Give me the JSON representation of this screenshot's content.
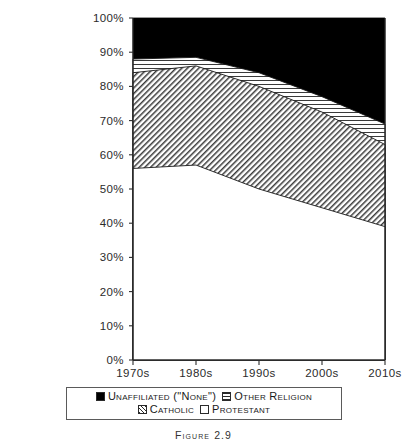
{
  "figure": {
    "caption": "Figure 2.9"
  },
  "legend": {
    "items": [
      {
        "label": "Unaffiliated (\"None\")",
        "swatch": "solid-black-swatch",
        "color": "#000000",
        "fill": "solid"
      },
      {
        "label": "Other Religion",
        "swatch": "horizontal-lines-swatch",
        "color": "#2b2b2b",
        "fill": "horizontal-lines"
      },
      {
        "label": "Catholic",
        "swatch": "diagonal-hatch-swatch",
        "color": "#2b2b2b",
        "fill": "diagonal-hatch"
      },
      {
        "label": "Protestant",
        "swatch": "white-swatch",
        "color": "#ffffff",
        "fill": "none"
      }
    ]
  },
  "chart_data": {
    "type": "area",
    "title": "",
    "subtitle": "",
    "xlabel": "",
    "ylabel": "",
    "stacked": true,
    "stack_total": 100,
    "grid": false,
    "legend_position": "bottom",
    "categories": [
      "1970s",
      "1980s",
      "1990s",
      "2000s",
      "2010s"
    ],
    "x_tick_labels": [
      "1970s",
      "1980s",
      "1990s",
      "2000s",
      "2010s"
    ],
    "y_tick_labels": [
      "0%",
      "10%",
      "20%",
      "30%",
      "40%",
      "50%",
      "60%",
      "70%",
      "80%",
      "90%",
      "100%"
    ],
    "y_ticks": [
      0,
      10,
      20,
      30,
      40,
      50,
      60,
      70,
      80,
      90,
      100
    ],
    "ylim": [
      0,
      100
    ],
    "series": [
      {
        "name": "Protestant",
        "fill": "none",
        "values": [
          56,
          57,
          50,
          44.5,
          39
        ]
      },
      {
        "name": "Catholic",
        "fill": "diagonal-hatch",
        "values": [
          28,
          29,
          30,
          28,
          24
        ]
      },
      {
        "name": "Other Religion",
        "fill": "horizontal-lines",
        "values": [
          4,
          2.5,
          4,
          4.5,
          6
        ]
      },
      {
        "name": "Unaffiliated (\"None\")",
        "fill": "solid",
        "values": [
          12,
          11.5,
          16,
          23,
          31
        ]
      }
    ],
    "cumulative_tops": {
      "protestant": [
        56,
        57,
        50,
        44.5,
        39
      ],
      "catholic": [
        84,
        86,
        80,
        72.5,
        63
      ],
      "other_religion": [
        88,
        88.5,
        84,
        77,
        69
      ],
      "unaffiliated": [
        100,
        100,
        100,
        100,
        100
      ]
    }
  }
}
